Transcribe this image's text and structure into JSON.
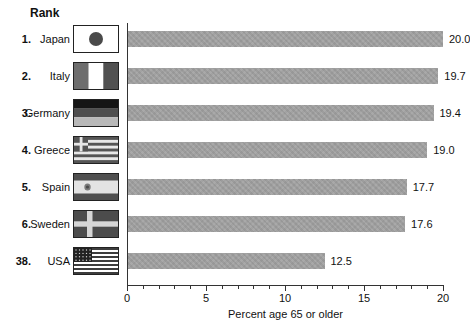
{
  "chart_data": {
    "type": "bar",
    "orientation": "horizontal",
    "rank_header": "Rank",
    "ranks": [
      "1.",
      "2.",
      "3.",
      "4.",
      "5.",
      "6.",
      "38."
    ],
    "categories": [
      "Japan",
      "Italy",
      "Germany",
      "Greece",
      "Spain",
      "Sweden",
      "USA"
    ],
    "values": [
      20.0,
      19.7,
      19.4,
      19.0,
      17.7,
      17.6,
      12.5
    ],
    "value_labels": [
      "20.0",
      "19.7",
      "19.4",
      "19.0",
      "17.7",
      "17.6",
      "12.5"
    ],
    "flags": [
      "japan-flag-icon",
      "italy-flag-icon",
      "germany-flag-icon",
      "greece-flag-icon",
      "spain-flag-icon",
      "sweden-flag-icon",
      "usa-flag-icon"
    ],
    "xlabel": "Percent age 65 or older",
    "xlim": [
      0,
      20
    ],
    "xticks": [
      "0",
      "5",
      "10",
      "15",
      "20"
    ],
    "minor_tick_interval": 1,
    "bar_color": "#a2a2a2",
    "grid": false,
    "legend": "none"
  }
}
